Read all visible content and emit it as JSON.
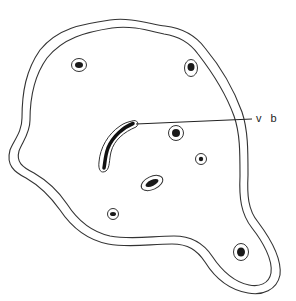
{
  "diagram": {
    "type": "cross-section line drawing",
    "colors": {
      "background": "#ffffff",
      "line": "#333333",
      "fill": "#1a1a1a"
    },
    "labels": [
      {
        "text": "v b",
        "x": 256,
        "y": 116,
        "points_to": "elongated vascular bundle"
      }
    ],
    "bundles": [
      {
        "id": "bundle-1",
        "cx": 78,
        "cy": 65,
        "rx": 7,
        "ry": 6
      },
      {
        "id": "bundle-2",
        "cx": 191,
        "cy": 68,
        "rx": 6,
        "ry": 8
      },
      {
        "id": "bundle-3",
        "cx": 176,
        "cy": 133,
        "rx": 7,
        "ry": 7
      },
      {
        "id": "bundle-4",
        "cx": 201,
        "cy": 159,
        "rx": 5,
        "ry": 5
      },
      {
        "id": "bundle-5",
        "cx": 152,
        "cy": 183,
        "rx": 11,
        "ry": 6
      },
      {
        "id": "bundle-6",
        "cx": 113,
        "cy": 214,
        "rx": 5,
        "ry": 5
      },
      {
        "id": "bundle-7",
        "cx": 241,
        "cy": 252,
        "rx": 7,
        "ry": 8
      }
    ]
  }
}
